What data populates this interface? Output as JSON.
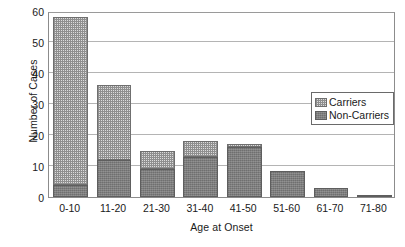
{
  "chart_data": {
    "type": "bar",
    "subtype": "stacked-vertical-bar",
    "title": "",
    "xlabel": "Age at Onset",
    "ylabel": "Number of Cases",
    "categories": [
      "0-10",
      "11-20",
      "21-30",
      "31-40",
      "41-50",
      "51-60",
      "61-70",
      "71-80"
    ],
    "series": [
      {
        "name": "Non-Carriers",
        "color": "#7c7c7c",
        "pattern": "solid-dark-gray",
        "values": [
          4,
          12,
          9,
          13,
          16,
          8.5,
          3,
          0.5
        ]
      },
      {
        "name": "Carriers",
        "color": "#dcdcdc",
        "pattern": "fine-checkered-light",
        "values": [
          54,
          24,
          6,
          5,
          1,
          0,
          0,
          0
        ]
      }
    ],
    "stack_totals": [
      58,
      36,
      15,
      18,
      17,
      8.5,
      3,
      0.5
    ],
    "ylim": [
      0,
      60
    ],
    "yticks": [
      0,
      10,
      20,
      30,
      40,
      50,
      60
    ],
    "ytick_labels": [
      "0",
      "10",
      "20",
      "30",
      "40",
      "50",
      "60"
    ],
    "grid": true,
    "grid_axis": "y",
    "legend_position": "inside-upper-right",
    "legend_entries": [
      "Carriers",
      "Non-Carriers"
    ]
  },
  "axes": {
    "y_title": "Number of Cases",
    "x_title": "Age at Onset"
  }
}
